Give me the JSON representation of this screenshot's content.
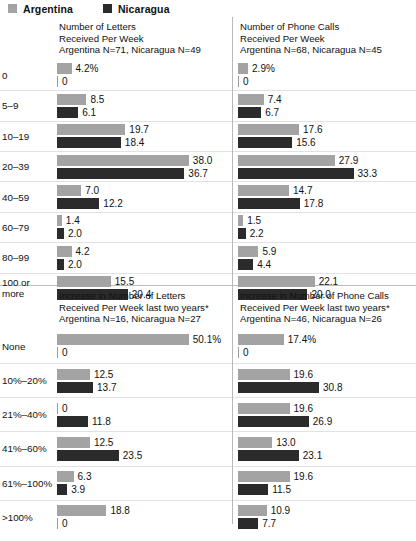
{
  "legend": {
    "items": [
      {
        "label": "Argentina",
        "color": "#a3a3a3",
        "key": "argentina"
      },
      {
        "label": "Nicaragua",
        "color": "#2b2b2b",
        "key": "nicaragua"
      }
    ]
  },
  "chart_data": [
    {
      "id": "letters-per-week",
      "type": "bar",
      "position": "top-left",
      "title": "Number of Letters\nReceived Per Week\nArgentina N=71,  Nicaragua N=49",
      "title_lines": [
        "Number of Letters",
        "Received Per Week",
        "Argentina N=71,  Nicaragua N=49"
      ],
      "sample_sizes": {
        "argentina": 71,
        "nicaragua": 49
      },
      "unit_suffix": "%",
      "first_value_suffix": "%",
      "xlabel": "",
      "ylabel": "",
      "xlim": [
        0,
        38
      ],
      "px_per_unit": 3.47,
      "grid": false,
      "categories": [
        "0",
        "5–9",
        "10–19",
        "20–39",
        "40–59",
        "60–79",
        "80–99",
        "100 or\nmore"
      ],
      "series": [
        {
          "name": "Argentina",
          "key": "argentina",
          "color": "#a3a3a3",
          "values": [
            4.2,
            8.5,
            19.7,
            38.0,
            7.0,
            1.4,
            4.2,
            15.5
          ],
          "labels": [
            "4.2%",
            "8.5",
            "19.7",
            "38.0",
            "7.0",
            "1.4",
            "4.2",
            "15.5"
          ]
        },
        {
          "name": "Nicaragua",
          "key": "nicaragua",
          "color": "#2b2b2b",
          "values": [
            0,
            6.1,
            18.4,
            36.7,
            12.2,
            2.0,
            2.0,
            20.4
          ],
          "labels": [
            "0",
            "6.1",
            "18.4",
            "36.7",
            "12.2",
            "2.0",
            "2.0",
            "20.4"
          ]
        }
      ]
    },
    {
      "id": "phone-calls-per-week",
      "type": "bar",
      "position": "top-right",
      "title": "Number of Phone Calls\nReceived Per Week\nArgentina N=68,  Nicaragua N=45",
      "title_lines": [
        "Number of Phone Calls",
        "Received Per Week",
        "Argentina N=68,  Nicaragua N=45"
      ],
      "sample_sizes": {
        "argentina": 68,
        "nicaragua": 45
      },
      "unit_suffix": "%",
      "first_value_suffix": "%",
      "xlabel": "",
      "ylabel": "",
      "xlim": [
        0,
        38
      ],
      "px_per_unit": 3.47,
      "grid": false,
      "categories": [
        "0",
        "5–9",
        "10–19",
        "20–39",
        "40–59",
        "60–79",
        "80–99",
        "100 or\nmore"
      ],
      "series": [
        {
          "name": "Argentina",
          "key": "argentina",
          "color": "#a3a3a3",
          "values": [
            2.9,
            7.4,
            17.6,
            27.9,
            14.7,
            1.5,
            5.9,
            22.1
          ],
          "labels": [
            "2.9%",
            "7.4",
            "17.6",
            "27.9",
            "14.7",
            "1.5",
            "5.9",
            "22.1"
          ]
        },
        {
          "name": "Nicaragua",
          "key": "nicaragua",
          "color": "#2b2b2b",
          "values": [
            0,
            6.7,
            15.6,
            33.3,
            17.8,
            2.2,
            4.4,
            20.0
          ],
          "labels": [
            "0",
            "6.7",
            "15.6",
            "33.3",
            "17.8",
            "2.2",
            "4.4",
            "20.0"
          ]
        }
      ]
    },
    {
      "id": "increase-letters",
      "type": "bar",
      "position": "bottom-left",
      "title": "Increase in Number of Letters\nReceived Per Week last two years*\nArgentina N=16,  Nicaragua N=27",
      "title_lines": [
        "Increase in Number of Letters",
        "Received Per Week last two years*",
        "Argentina N=16,  Nicaragua N=27"
      ],
      "sample_sizes": {
        "argentina": 16,
        "nicaragua": 27
      },
      "unit_suffix": "%",
      "first_value_suffix": "%",
      "xlabel": "",
      "ylabel": "",
      "xlim": [
        0,
        50.1
      ],
      "px_per_unit": 2.63,
      "grid": false,
      "categories": [
        "None",
        "10%–20%",
        "21%–40%",
        "41%–60%",
        "61%–100%",
        ">100%"
      ],
      "series": [
        {
          "name": "Argentina",
          "key": "argentina",
          "color": "#a3a3a3",
          "values": [
            50.1,
            12.5,
            0,
            12.5,
            6.3,
            18.8
          ],
          "labels": [
            "50.1%",
            "12.5",
            "0",
            "12.5",
            "6.3",
            "18.8"
          ]
        },
        {
          "name": "Nicaragua",
          "key": "nicaragua",
          "color": "#2b2b2b",
          "values": [
            0,
            13.7,
            11.8,
            23.5,
            3.9,
            0
          ],
          "labels": [
            "0",
            "13.7",
            "11.8",
            "23.5",
            "3.9",
            "0"
          ]
        }
      ]
    },
    {
      "id": "increase-phone-calls",
      "type": "bar",
      "position": "bottom-right",
      "title": "Increase in Number of Phone Calls\nReceived Per Week last two years*\nArgentina N=46,  Nicaragua N=26",
      "title_lines": [
        "Increase in Number of Phone Calls",
        "Received Per Week last two years*",
        "Argentina N=46,  Nicaragua N=26"
      ],
      "sample_sizes": {
        "argentina": 46,
        "nicaragua": 26
      },
      "unit_suffix": "%",
      "first_value_suffix": "%",
      "xlabel": "",
      "ylabel": "",
      "xlim": [
        0,
        50.1
      ],
      "px_per_unit": 2.63,
      "grid": false,
      "categories": [
        "None",
        "10%–20%",
        "21%–40%",
        "41%–60%",
        "61%–100%",
        ">100%"
      ],
      "series": [
        {
          "name": "Argentina",
          "key": "argentina",
          "color": "#a3a3a3",
          "values": [
            17.4,
            19.6,
            19.6,
            13.0,
            19.6,
            10.9
          ],
          "labels": [
            "17.4%",
            "19.6",
            "19.6",
            "13.0",
            "19.6",
            "10.9"
          ]
        },
        {
          "name": "Nicaragua",
          "key": "nicaragua",
          "color": "#2b2b2b",
          "values": [
            0,
            30.8,
            26.9,
            23.1,
            11.5,
            7.7
          ],
          "labels": [
            "0",
            "30.8",
            "26.9",
            "23.1",
            "11.5",
            "7.7"
          ]
        }
      ]
    }
  ]
}
